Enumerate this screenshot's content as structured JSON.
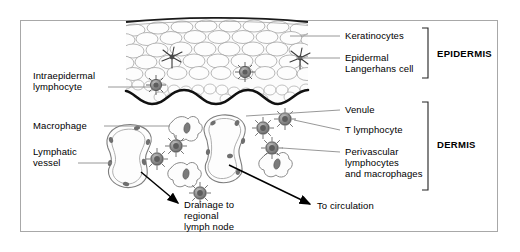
{
  "figure": {
    "title_present": false,
    "border_color": "#a8a8a8",
    "background": "#ffffff"
  },
  "labels": {
    "left": [
      {
        "id": "intraepidermal-lymphocyte",
        "line1": "Intraepidermal",
        "line2": "lymphocyte"
      },
      {
        "id": "macrophage",
        "line1": "Macrophage",
        "line2": ""
      },
      {
        "id": "lymphatic-vessel",
        "line1": "Lymphatic",
        "line2": "vessel"
      }
    ],
    "right": [
      {
        "id": "keratinocytes",
        "line1": "Keratinocytes",
        "line2": "",
        "line3": ""
      },
      {
        "id": "epidermal-langerhans-cell",
        "line1": "Epidermal",
        "line2": "Langerhans cell",
        "line3": ""
      },
      {
        "id": "venule",
        "line1": "Venule",
        "line2": "",
        "line3": ""
      },
      {
        "id": "t-lymphocyte",
        "line1": "T lymphocyte",
        "line2": "",
        "line3": ""
      },
      {
        "id": "perivascular-lymphocytes-and-macrophages",
        "line1": "Perivascular",
        "line2": "lymphocytes",
        "line3": "and macrophages"
      }
    ],
    "brackets": [
      {
        "id": "epidermis",
        "text": "EPIDERMIS"
      },
      {
        "id": "dermis",
        "text": "DERMIS"
      }
    ],
    "arrows": [
      {
        "id": "drainage-to-regional-lymph-node",
        "line1": "Drainage to",
        "line2": "regional",
        "line3": "lymph node"
      },
      {
        "id": "to-circulation",
        "line1": "To circulation",
        "line2": "",
        "line3": ""
      }
    ]
  },
  "colors": {
    "ink": "#000000",
    "leader": "#8c8c8c",
    "cell_outline": "#9a9a9a",
    "cell_fill": "#fbfbfb",
    "lymphocyte_fill": "#8a8a8a",
    "lymphocyte_ring": "#5a5a5a",
    "membrane": "#111111",
    "vessel_outline": "#7d7d7d",
    "nucleus": "#6f6f6f"
  }
}
